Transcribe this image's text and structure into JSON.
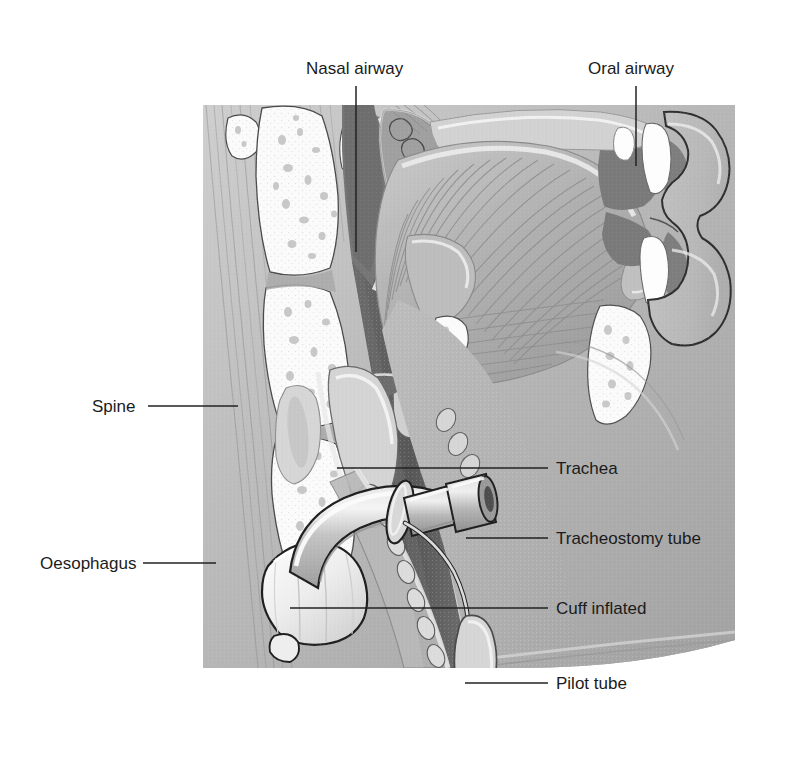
{
  "figure": {
    "background_color": "#ffffff",
    "label_color": "#1b1b1b",
    "leader_line_color": "#222222",
    "illustration_bounds": {
      "x": 203,
      "y": 105,
      "width": 532,
      "height": 565
    },
    "palette": {
      "soft_tissue_mid": "#a8a8a8",
      "soft_tissue_light": "#c9c9c9",
      "soft_tissue_pale": "#dcdcdc",
      "airway_dark": "#6f6f6f",
      "oesophagus_dark": "#5d5d5d",
      "bone_white": "#fbfbfb",
      "tube_fill": "#c2c2c2",
      "cuff_white": "#f4f4f4",
      "outline": "#2b2b2b"
    }
  },
  "labels": [
    {
      "id": "nasal-airway",
      "text": "Nasal airway",
      "text_x": 306,
      "text_y": 74,
      "anchor": "start",
      "leader": {
        "type": "vertical",
        "x": 356,
        "y1": 86,
        "y2": 252
      }
    },
    {
      "id": "oral-airway",
      "text": "Oral airway",
      "text_x": 588,
      "text_y": 74,
      "anchor": "start",
      "leader": {
        "type": "vertical",
        "x": 636,
        "y1": 86,
        "y2": 166
      }
    },
    {
      "id": "spine",
      "text": "Spine",
      "text_x": 92,
      "text_y": 412,
      "anchor": "start",
      "leader": {
        "type": "horizontal",
        "y": 406,
        "x1": 148,
        "x2": 238
      }
    },
    {
      "id": "oesophagus",
      "text": "Oesophagus",
      "text_x": 40,
      "text_y": 569,
      "anchor": "start",
      "leader": {
        "type": "horizontal",
        "y": 563,
        "x1": 143,
        "x2": 216
      }
    },
    {
      "id": "trachea",
      "text": "Trachea",
      "text_x": 556,
      "text_y": 474,
      "anchor": "start",
      "leader": {
        "type": "horizontal",
        "y": 468,
        "x1": 337,
        "x2": 548
      }
    },
    {
      "id": "tracheostomy-tube",
      "text": "Tracheostomy tube",
      "text_x": 556,
      "text_y": 544,
      "anchor": "start",
      "leader": {
        "type": "horizontal",
        "y": 538,
        "x1": 466,
        "x2": 548
      }
    },
    {
      "id": "cuff-inflated",
      "text": "Cuff inflated",
      "text_x": 556,
      "text_y": 614,
      "anchor": "start",
      "leader": {
        "type": "horizontal",
        "y": 608,
        "x1": 290,
        "x2": 548
      }
    },
    {
      "id": "pilot-tube",
      "text": "Pilot tube",
      "text_x": 556,
      "text_y": 689,
      "anchor": "start",
      "leader": {
        "type": "horizontal",
        "y": 683,
        "x1": 465,
        "x2": 548
      }
    }
  ],
  "anatomy_parts": [
    "cervical vertebrae",
    "nasal cavity and turbinates",
    "hard palate",
    "soft palate",
    "tongue",
    "teeth",
    "lips",
    "mandible",
    "hyoid bone",
    "epiglottis",
    "larynx",
    "thyroid cartilage",
    "tracheal rings",
    "trachea",
    "oesophagus",
    "chest wall"
  ],
  "device_parts": [
    "tracheostomy tube shaft",
    "neck flange",
    "15 mm connector",
    "inflated cuff",
    "pilot tube",
    "pilot balloon",
    "inflation valve"
  ]
}
